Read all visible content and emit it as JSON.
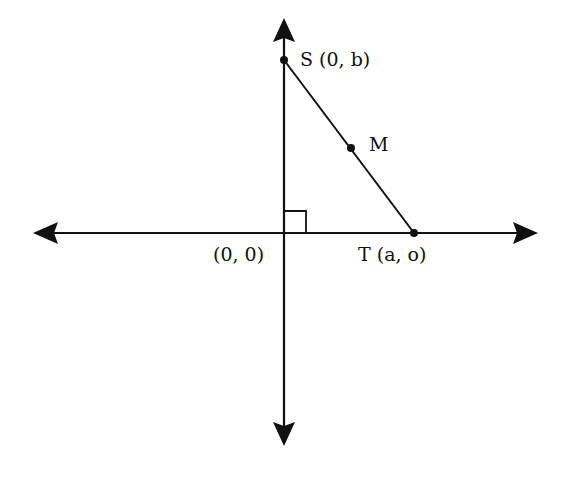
{
  "diagram": {
    "points": {
      "S": {
        "label": "S (0, b)",
        "x": 0,
        "y": "b"
      },
      "T": {
        "label": "T (a, o)",
        "x": "a",
        "y": 0
      },
      "O": {
        "label": "(0, 0)",
        "x": 0,
        "y": 0
      },
      "M": {
        "label": "M",
        "note": "midpoint of ST"
      }
    },
    "segments": [
      "ST"
    ],
    "right_angle_marker": "origin",
    "axes": {
      "x_axis": "double-arrow horizontal",
      "y_axis": "double-arrow vertical"
    },
    "colors": {
      "stroke": "#111111",
      "background": "#ffffff"
    }
  }
}
